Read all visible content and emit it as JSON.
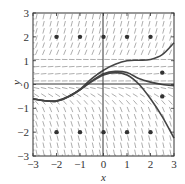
{
  "chart_data": {
    "type": "line",
    "subtype": "slope-field",
    "title": "",
    "xlabel": "x",
    "ylabel": "y",
    "xlim": [
      -3,
      3
    ],
    "ylim": [
      -3,
      3
    ],
    "x_ticks": [
      -3,
      -2,
      -1,
      0,
      1,
      2,
      3
    ],
    "y_ticks": [
      -3,
      -2,
      -1,
      0,
      1,
      2,
      3
    ],
    "x_tick_labels": [
      "−3",
      "−2",
      "−1",
      "0",
      "1",
      "2",
      "3"
    ],
    "y_tick_labels": [
      "−3",
      "−2",
      "−1",
      "0",
      "1",
      "2",
      "3"
    ],
    "grid": false,
    "legend": null,
    "points": [
      {
        "x": -2,
        "y": 2
      },
      {
        "x": -1,
        "y": 2
      },
      {
        "x": 0,
        "y": 2
      },
      {
        "x": 1,
        "y": 2
      },
      {
        "x": 2,
        "y": 2
      },
      {
        "x": 2.5,
        "y": 0.5
      },
      {
        "x": 2.5,
        "y": -0.5
      },
      {
        "x": -2,
        "y": -2
      },
      {
        "x": -1,
        "y": -2
      },
      {
        "x": 0,
        "y": -2
      },
      {
        "x": 1,
        "y": -2
      },
      {
        "x": 2,
        "y": -2
      }
    ],
    "series": [
      {
        "name": "solution-upper",
        "x": [
          -3,
          -2.5,
          -2,
          -1.5,
          -1,
          -0.5,
          0,
          0.5,
          1,
          1.5,
          2,
          2.5,
          3
        ],
        "y": [
          -0.6,
          -0.68,
          -0.68,
          -0.5,
          -0.2,
          0.25,
          0.6,
          0.85,
          1.0,
          1.02,
          1.05,
          1.25,
          1.75
        ]
      },
      {
        "name": "solution-middle",
        "x": [
          -3,
          -2.5,
          -2,
          -1.5,
          -1,
          -0.5,
          0,
          0.5,
          1,
          1.5,
          2,
          2.5,
          3
        ],
        "y": [
          -0.6,
          -0.68,
          -0.7,
          -0.52,
          -0.22,
          0.15,
          0.45,
          0.55,
          0.5,
          0.25,
          0.1,
          0.0,
          -0.05
        ]
      },
      {
        "name": "solution-lower",
        "x": [
          -3,
          -2.5,
          -2,
          -1.5,
          -1,
          -0.5,
          0,
          0.5,
          1,
          1.5,
          2,
          2.5,
          3
        ],
        "y": [
          -0.6,
          -0.68,
          -0.7,
          -0.52,
          -0.22,
          0.12,
          0.4,
          0.5,
          0.4,
          0.02,
          -0.6,
          -1.35,
          -2.25
        ]
      }
    ],
    "slope_field": {
      "description": "Short line segments on a grid showing dy/dx; steep positive slopes in upper region (y>1.2), near-flat around y≈0 to 1, steep negative slopes in lower region (y<-0.8)",
      "grid_spacing": 0.3
    }
  }
}
